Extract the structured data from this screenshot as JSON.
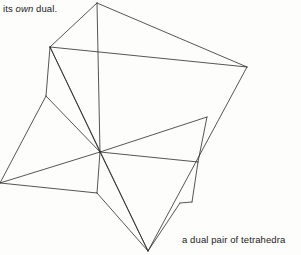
{
  "page": {
    "background_color": "#fdfdfc",
    "ink_color": "#2b2b2b",
    "width": 301,
    "height": 255
  },
  "running_text": {
    "before_italic": "its ",
    "italic_word": "own",
    "after_italic": " dual."
  },
  "figure": {
    "caption": "a dual pair of tetrahedra",
    "stroke_color": "#2b2b2b",
    "stroke_width": 0.8,
    "vertices": {
      "t1_apex_top": [
        97,
        3
      ],
      "t1_left": [
        50,
        47
      ],
      "t1_right": [
        247,
        67
      ],
      "t1_bottom": [
        148,
        251
      ],
      "t2_upper_left": [
        46,
        96
      ],
      "t2_far_left": [
        0,
        183
      ],
      "t2_right": [
        207,
        117
      ],
      "t2_hub": [
        100,
        152
      ],
      "t2_lower_mid": [
        97,
        193
      ],
      "t2_lower_right": [
        198,
        162
      ],
      "spur_a": [
        180,
        203
      ],
      "spur_b": [
        192,
        202
      ]
    },
    "edges": [
      [
        "t1_apex_top",
        "t1_left"
      ],
      [
        "t1_apex_top",
        "t1_right"
      ],
      [
        "t1_left",
        "t1_right"
      ],
      [
        "t1_left",
        "t1_bottom"
      ],
      [
        "t1_right",
        "t1_bottom"
      ],
      [
        "t1_left",
        "t2_upper_left"
      ],
      [
        "t2_upper_left",
        "t2_far_left"
      ],
      [
        "t2_far_left",
        "t2_lower_mid"
      ],
      [
        "t2_upper_left",
        "t2_hub"
      ],
      [
        "t2_hub",
        "t1_left"
      ],
      [
        "t2_hub",
        "t1_apex_top"
      ],
      [
        "t2_hub",
        "t2_far_left"
      ],
      [
        "t2_hub",
        "t2_right"
      ],
      [
        "t2_hub",
        "t2_lower_right"
      ],
      [
        "t2_hub",
        "t2_lower_mid"
      ],
      [
        "t2_hub",
        "t1_bottom"
      ],
      [
        "t2_right",
        "t2_lower_right"
      ],
      [
        "t2_lower_right",
        "spur_b"
      ],
      [
        "spur_b",
        "spur_a"
      ],
      [
        "t2_lower_mid",
        "t1_bottom"
      ],
      [
        "t1_bottom",
        "spur_a"
      ]
    ]
  }
}
